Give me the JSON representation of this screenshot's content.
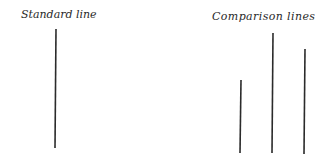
{
  "labels": {
    "standard": "Standard line",
    "comparison": "Comparison lines"
  },
  "lines": {
    "standard": {
      "x1": 56,
      "y1": 29,
      "x2": 55,
      "y2": 148
    },
    "comparison": [
      {
        "x1": 241,
        "y1": 80,
        "x2": 240,
        "y2": 153
      },
      {
        "x1": 273,
        "y1": 33,
        "x2": 272,
        "y2": 153
      },
      {
        "x1": 305,
        "y1": 49,
        "x2": 304,
        "y2": 154
      }
    ]
  },
  "colors": {
    "line": "#2b2b2b",
    "text": "#2a2a2a"
  }
}
